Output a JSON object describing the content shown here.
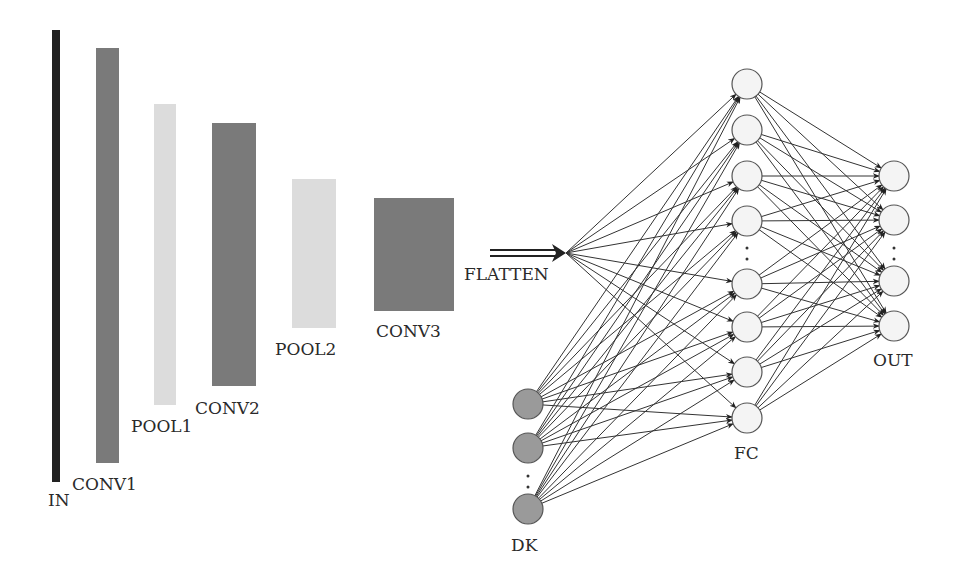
{
  "colors": {
    "input": "#222222",
    "conv": "#7a7a7a",
    "pool": "#dcdcdc",
    "fc_node": "#f4f4f4",
    "dk_node": "#9a9a9a",
    "edge": "#333333"
  },
  "layers": [
    {
      "id": "in",
      "label": "IN",
      "kind": "input"
    },
    {
      "id": "conv1",
      "label": "CONV1",
      "kind": "conv"
    },
    {
      "id": "pool1",
      "label": "POOL1",
      "kind": "pool"
    },
    {
      "id": "conv2",
      "label": "CONV2",
      "kind": "conv"
    },
    {
      "id": "pool2",
      "label": "POOL2",
      "kind": "pool"
    },
    {
      "id": "conv3",
      "label": "CONV3",
      "kind": "conv"
    }
  ],
  "flatten": {
    "label": "FLATTEN"
  },
  "fc": {
    "label": "FC",
    "nodes_top": 4,
    "nodes_bottom": 4,
    "ellipsis": ":"
  },
  "out": {
    "label": "OUT",
    "nodes_top": 2,
    "nodes_bottom": 2,
    "ellipsis": ":"
  },
  "dk": {
    "label": "DK",
    "nodes_top": 2,
    "nodes_bottom": 1,
    "ellipsis": ":"
  },
  "connections": [
    {
      "from": "flatten",
      "to": "fc",
      "type": "fully-connected"
    },
    {
      "from": "dk",
      "to": "fc",
      "type": "fully-connected"
    },
    {
      "from": "fc",
      "to": "out",
      "type": "fully-connected"
    }
  ]
}
